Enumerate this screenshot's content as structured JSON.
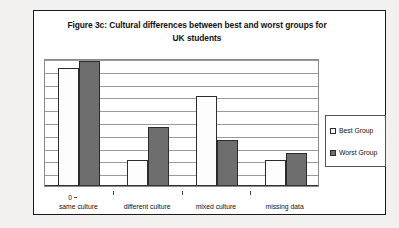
{
  "chart_data": {
    "type": "bar",
    "title": "Figure 3c: Cultural differences between best and worst groups for UK students",
    "title_line1": "Figure 3c: Cultural differences between best and worst groups for",
    "title_line2": "UK students",
    "xlabel": "",
    "ylabel": "",
    "ylim": [
      0,
      50
    ],
    "ytick_step": 5,
    "grid": true,
    "legend_position": "right",
    "categories": [
      "same culture",
      "different culture",
      "mixed culture",
      "missing data"
    ],
    "yticks": [
      "0",
      "5",
      "10",
      "15",
      "20",
      "25",
      "30",
      "35",
      "40",
      "45",
      "50"
    ],
    "series": [
      {
        "name": "Best Group",
        "color": "#fdfdfd",
        "values": [
          46,
          10,
          35,
          10
        ]
      },
      {
        "name": "Worst Group",
        "color": "#6e6e6e",
        "values": [
          49,
          23,
          18,
          13
        ]
      }
    ]
  },
  "legend": {
    "items": [
      {
        "label": "Best Group",
        "swatch": "#fdfdfd"
      },
      {
        "label": "Worst Group",
        "swatch": "#6e6e6e"
      }
    ]
  }
}
